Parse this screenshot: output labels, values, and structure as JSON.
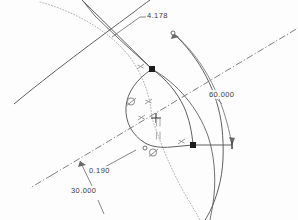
{
  "app": {
    "view_name": "cad-sketch-viewport",
    "background_color": "#fdfdfd"
  },
  "colors": {
    "geometry": "#5a5a5a",
    "construction": "#9a9a9a",
    "centerline": "#6e6e6e",
    "dimension": "#6a6a6a",
    "text": "#3a3a3a",
    "node_selected": "#1c1c1c",
    "constraint_icon": "#8c8c8c"
  },
  "dimensions": [
    {
      "id": "dim-4178",
      "label": "4.178",
      "kind": "linear-radius",
      "value": 4.178,
      "x": 146,
      "y": 13
    },
    {
      "id": "dim-60000",
      "label": "60.000",
      "kind": "angular",
      "value": 60.0,
      "x": 208,
      "y": 93
    },
    {
      "id": "dim-0190",
      "label": "0.190",
      "kind": "linear",
      "value": 0.19,
      "x": 88,
      "y": 169
    },
    {
      "id": "dim-30000",
      "label": "30.000",
      "kind": "angular",
      "value": 30.0,
      "x": 70,
      "y": 188
    }
  ],
  "nodes": [
    {
      "id": "node-top",
      "name": "sketch-point-top",
      "x": 152,
      "y": 69,
      "state": "selected"
    },
    {
      "id": "node-right",
      "name": "sketch-point-right",
      "x": 193,
      "y": 145,
      "state": "selected"
    },
    {
      "id": "node-origin",
      "name": "sketch-origin",
      "x": 156,
      "y": 118,
      "state": "reference"
    },
    {
      "id": "node-arcend",
      "name": "sketch-point-arc-end",
      "x": 173,
      "y": 33,
      "state": "open"
    },
    {
      "id": "node-arcbot",
      "name": "sketch-point-arc-bottom",
      "x": 145,
      "y": 148,
      "state": "open"
    }
  ],
  "constraint_icons": [
    {
      "id": "c1",
      "name": "tangent-constraint-icon",
      "glyph": "tangent",
      "x": 131,
      "y": 101
    },
    {
      "id": "c2",
      "name": "tangent-constraint-icon",
      "glyph": "tangent",
      "x": 153,
      "y": 152
    },
    {
      "id": "c3",
      "name": "coincident-constraint-icon",
      "glyph": "coincident",
      "x": 148,
      "y": 101
    },
    {
      "id": "c4",
      "name": "coincident-constraint-icon",
      "glyph": "coincident",
      "x": 141,
      "y": 117
    },
    {
      "id": "c5",
      "name": "coincident-constraint-icon",
      "glyph": "coincident",
      "x": 140,
      "y": 66
    },
    {
      "id": "c6",
      "name": "coincident-constraint-icon",
      "glyph": "coincident",
      "x": 181,
      "y": 141
    },
    {
      "id": "c7",
      "name": "vertical-constraint-icon",
      "glyph": "vertical",
      "x": 157,
      "y": 122
    },
    {
      "id": "c8",
      "name": "vertical-constraint-icon",
      "glyph": "vertical",
      "x": 157,
      "y": 135
    }
  ],
  "legend": {
    "geometry_line": "solid profile arc",
    "construction_line": "dotted construction arc",
    "center_line": "dash-dot centerline"
  }
}
